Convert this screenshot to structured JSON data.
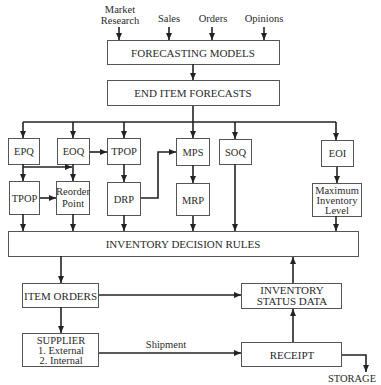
{
  "inputs": [
    {
      "line1": "Market",
      "line2": "Research"
    },
    {
      "label": "Sales"
    },
    {
      "label": "Orders"
    },
    {
      "label": "Opinions"
    }
  ],
  "boxes": {
    "forecasting_models": "FORECASTING MODELS",
    "end_item_forecasts": "END ITEM FORECASTS",
    "epq": "EPQ",
    "eoq": "EOQ",
    "tpop_upper": "TPOP",
    "mps": "MPS",
    "soq": "SOQ",
    "eoi": "EOI",
    "tpop_lower": "TPOP",
    "reorder_point": {
      "line1": "Reorder",
      "line2": "Point"
    },
    "drp": "DRP",
    "mrp": "MRP",
    "max_inventory": {
      "line1": "Maximum",
      "line2": "Inventory",
      "line3": "Level"
    },
    "inventory_decision_rules": "INVENTORY DECISION RULES",
    "item_orders": "ITEM ORDERS",
    "inventory_status_data": {
      "line1": "INVENTORY",
      "line2": "STATUS DATA"
    },
    "supplier": {
      "line1": "SUPPLIER",
      "line2": "1. External",
      "line3": "2. Internal"
    },
    "receipt": "RECEIPT"
  },
  "edge_labels": {
    "shipment": "Shipment",
    "storage": "STORAGE"
  },
  "colors": {
    "line": "#222222",
    "box_border": "#555555",
    "text": "#2a2a2a",
    "background": "#ffffff"
  }
}
